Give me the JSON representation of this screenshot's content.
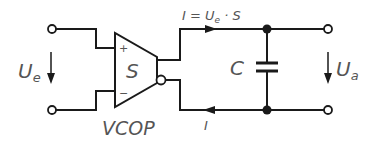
{
  "diagram": {
    "input_voltage": {
      "main": "U",
      "sub": "e"
    },
    "output_voltage": {
      "main": "U",
      "sub": "a"
    },
    "amplifier": {
      "symbol": "S",
      "name": "VCOP",
      "plus": "+",
      "minus": "−"
    },
    "capacitor": "C",
    "current_top": {
      "lhs": "I = U",
      "sub": "e",
      "rhs": " · S"
    },
    "current_bottom": "I",
    "colors": {
      "line": "#1a1a1a",
      "text": "#555555",
      "background": "#ffffff"
    }
  }
}
